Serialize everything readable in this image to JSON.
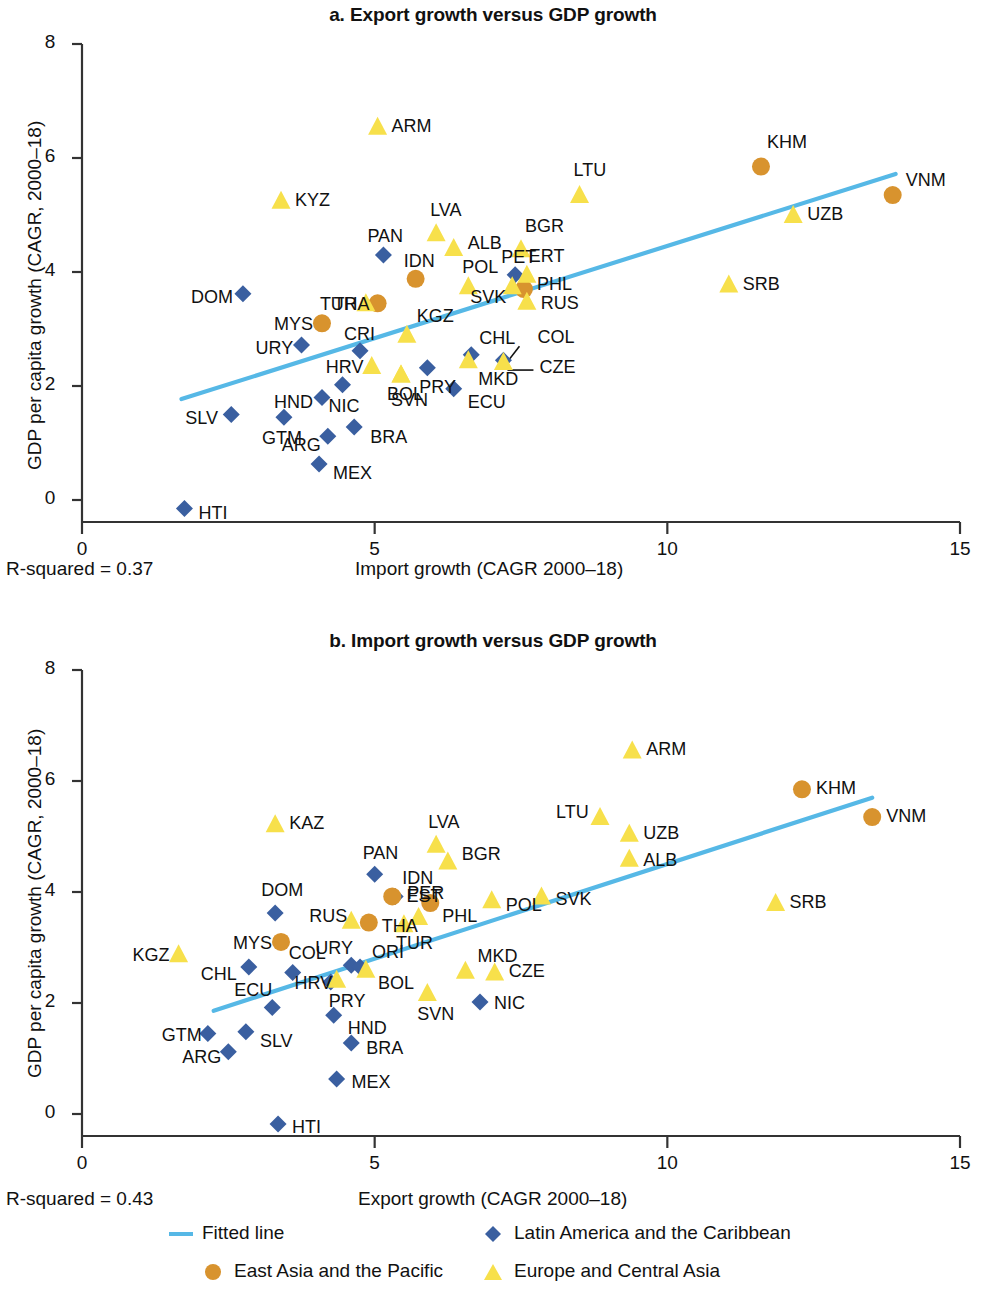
{
  "figure": {
    "colors": {
      "fitted_line": "#56b8e6",
      "latin_america": "#3a5fa0",
      "east_asia": "#d8932e",
      "europe_central_asia": "#f7e04b",
      "axis": "#333333",
      "text": "#111111"
    },
    "legend": [
      {
        "label": "Fitted line",
        "marker": "line",
        "color": "#56b8e6"
      },
      {
        "label": "Latin America and the Caribbean",
        "marker": "diamond",
        "color": "#3a5fa0"
      },
      {
        "label": "East Asia and the Pacific",
        "marker": "circle",
        "color": "#d8932e"
      },
      {
        "label": "Europe and Central Asia",
        "marker": "triangle",
        "color": "#f7e04b"
      }
    ]
  },
  "chart_data": [
    {
      "panel": "a",
      "type": "scatter",
      "title": "a. Export growth versus GDP growth",
      "xlabel": "Import growth (CAGR 2000–18)",
      "ylabel": "GDP per capita growth (CAGR, 2000–18)",
      "xlim": [
        0,
        15
      ],
      "ylim": [
        0,
        8
      ],
      "xticks": [
        0,
        5,
        10,
        15
      ],
      "xtick_labels": [
        "0",
        "5",
        "10",
        "15"
      ],
      "yticks": [
        0,
        2,
        4,
        6,
        8
      ],
      "ytick_labels": [
        "0",
        "2",
        "4",
        "6",
        "8"
      ],
      "grid": false,
      "annotation": "R-squared = 0.37",
      "r_squared": 0.37,
      "fit_line": {
        "x": [
          1.7,
          13.9
        ],
        "y": [
          1.77,
          5.72
        ]
      },
      "series": [
        {
          "name": "Latin America and the Caribbean",
          "marker": "diamond",
          "color": "#3a5fa0",
          "points": [
            {
              "code": "HTI",
              "x": 1.75,
              "y": -0.15,
              "lx": 14,
              "ly": 5
            },
            {
              "code": "SLV",
              "x": 2.55,
              "y": 1.5,
              "lx": -46,
              "ly": 4
            },
            {
              "code": "GTM",
              "x": 3.45,
              "y": 1.45,
              "lx": -22,
              "ly": 22
            },
            {
              "code": "ARG",
              "x": 4.2,
              "y": 1.12,
              "lx": -46,
              "ly": 10
            },
            {
              "code": "MEX",
              "x": 4.05,
              "y": 0.63,
              "lx": 14,
              "ly": 10
            },
            {
              "code": "BRA",
              "x": 4.65,
              "y": 1.28,
              "lx": 16,
              "ly": 11
            },
            {
              "code": "HND",
              "x": 4.1,
              "y": 1.8,
              "lx": -48,
              "ly": 6
            },
            {
              "code": "NIC",
              "x": 4.45,
              "y": 2.02,
              "lx": -14,
              "ly": 22
            },
            {
              "code": "URY",
              "x": 3.75,
              "y": 2.72,
              "lx": -46,
              "ly": 4
            },
            {
              "code": "CRI",
              "x": 4.75,
              "y": 2.62,
              "lx": -16,
              "ly": -16
            },
            {
              "code": "PRY",
              "x": 5.9,
              "y": 2.32,
              "lx": -8,
              "ly": 20
            },
            {
              "code": "ECU",
              "x": 6.35,
              "y": 1.95,
              "lx": 14,
              "ly": 14
            },
            {
              "code": "CHL",
              "x": 6.65,
              "y": 2.55,
              "lx": 8,
              "ly": -16
            },
            {
              "code": "COL",
              "x": 7.2,
              "y": 2.45,
              "lx": 34,
              "ly": -22
            },
            {
              "code": "PAN",
              "x": 5.15,
              "y": 4.3,
              "lx": -16,
              "ly": -18
            },
            {
              "code": "DOM",
              "x": 2.75,
              "y": 3.62,
              "lx": -52,
              "ly": 4
            },
            {
              "code": "PET",
              "x": 7.4,
              "y": 3.95,
              "lx": -14,
              "ly": -17
            }
          ]
        },
        {
          "name": "East Asia and the Pacific",
          "marker": "circle",
          "color": "#d8932e",
          "points": [
            {
              "code": "MYS",
              "x": 4.1,
              "y": 3.1,
              "lx": -48,
              "ly": 2
            },
            {
              "code": "THA",
              "x": 5.05,
              "y": 3.45,
              "lx": -44,
              "ly": 2
            },
            {
              "code": "IDN",
              "x": 5.7,
              "y": 3.88,
              "lx": -12,
              "ly": -17
            },
            {
              "code": "PHL",
              "x": 7.55,
              "y": 3.7,
              "lx": 13,
              "ly": -4
            },
            {
              "code": "KHM",
              "x": 11.6,
              "y": 5.85,
              "lx": 6,
              "ly": -24
            },
            {
              "code": "VNM",
              "x": 13.85,
              "y": 5.35,
              "lx": 13,
              "ly": -14
            }
          ]
        },
        {
          "name": "Europe and Central Asia",
          "marker": "triangle",
          "color": "#f7e04b",
          "points": [
            {
              "code": "ARM",
              "x": 5.05,
              "y": 6.55,
              "lx": 14,
              "ly": 0
            },
            {
              "code": "KYZ",
              "x": 3.4,
              "y": 5.25,
              "lx": 14,
              "ly": 0
            },
            {
              "code": "LVA",
              "x": 6.05,
              "y": 4.68,
              "lx": -6,
              "ly": -22
            },
            {
              "code": "ALB",
              "x": 6.35,
              "y": 4.42,
              "lx": 14,
              "ly": -4
            },
            {
              "code": "LTU",
              "x": 8.5,
              "y": 5.35,
              "lx": -6,
              "ly": -24
            },
            {
              "code": "BGR",
              "x": 7.5,
              "y": 4.4,
              "lx": 4,
              "ly": -22
            },
            {
              "code": "UZB",
              "x": 12.15,
              "y": 5.0,
              "lx": 14,
              "ly": 0
            },
            {
              "code": "SRB",
              "x": 11.05,
              "y": 3.78,
              "lx": 14,
              "ly": 0
            },
            {
              "code": "POL",
              "x": 6.6,
              "y": 3.75,
              "lx": -6,
              "ly": -18
            },
            {
              "code": "ERT",
              "x": 7.6,
              "y": 3.95,
              "lx": 2,
              "ly": -18
            },
            {
              "code": "RUS",
              "x": 7.6,
              "y": 3.48,
              "lx": 14,
              "ly": 2
            },
            {
              "code": "TUR",
              "x": 4.85,
              "y": 3.45,
              "lx": -46,
              "ly": 2
            },
            {
              "code": "KGZ",
              "x": 5.55,
              "y": 2.9,
              "lx": 10,
              "ly": -18
            },
            {
              "code": "HRV",
              "x": 4.95,
              "y": 2.35,
              "lx": -46,
              "ly": 2
            },
            {
              "code": "BOL",
              "x": 5.45,
              "y": 2.2,
              "lx": -14,
              "ly": 20
            },
            {
              "code": "SVN",
              "x": 5.45,
              "y": 2.2,
              "lx": -10,
              "ly": 26
            },
            {
              "code": "MKD",
              "x": 6.6,
              "y": 2.45,
              "lx": 10,
              "ly": 20
            },
            {
              "code": "CZE",
              "x": 7.2,
              "y": 2.42,
              "lx": 36,
              "ly": 6
            },
            {
              "code": "SVK",
              "x": 7.35,
              "y": 3.75,
              "lx": -42,
              "ly": 12
            }
          ]
        }
      ]
    },
    {
      "panel": "b",
      "type": "scatter",
      "title": "b. Import growth versus GDP growth",
      "xlabel": "Export growth (CAGR 2000–18)",
      "ylabel": "GDP per capita growth (CAGR, 2000–18)",
      "xlim": [
        0,
        15
      ],
      "ylim": [
        0,
        8
      ],
      "xticks": [
        0,
        5,
        10,
        15
      ],
      "xtick_labels": [
        "0",
        "5",
        "10",
        "15"
      ],
      "yticks": [
        0,
        2,
        4,
        6,
        8
      ],
      "ytick_labels": [
        "0",
        "2",
        "4",
        "6",
        "8"
      ],
      "grid": false,
      "annotation": "R-squared = 0.43",
      "r_squared": 0.43,
      "fit_line": {
        "x": [
          2.25,
          13.5
        ],
        "y": [
          1.86,
          5.7
        ]
      },
      "series": [
        {
          "name": "Latin America and the Caribbean",
          "marker": "diamond",
          "color": "#3a5fa0",
          "points": [
            {
              "code": "HTI",
              "x": 3.35,
              "y": -0.18,
              "lx": 14,
              "ly": 4
            },
            {
              "code": "ARG",
              "x": 2.5,
              "y": 1.12,
              "lx": -46,
              "ly": 6
            },
            {
              "code": "GTM",
              "x": 2.15,
              "y": 1.45,
              "lx": -46,
              "ly": 2
            },
            {
              "code": "SLV",
              "x": 2.8,
              "y": 1.48,
              "lx": 14,
              "ly": 10
            },
            {
              "code": "MEX",
              "x": 4.35,
              "y": 0.63,
              "lx": 15,
              "ly": 4
            },
            {
              "code": "BRA",
              "x": 4.6,
              "y": 1.28,
              "lx": 15,
              "ly": 6
            },
            {
              "code": "HND",
              "x": 4.3,
              "y": 1.78,
              "lx": 14,
              "ly": 14
            },
            {
              "code": "ECU",
              "x": 3.25,
              "y": 1.92,
              "lx": -38,
              "ly": -16
            },
            {
              "code": "CHL",
              "x": 2.85,
              "y": 2.65,
              "lx": -48,
              "ly": 8
            },
            {
              "code": "COL",
              "x": 3.6,
              "y": 2.55,
              "lx": -4,
              "ly": -18
            },
            {
              "code": "URY",
              "x": 4.6,
              "y": 2.68,
              "lx": -36,
              "ly": -16
            },
            {
              "code": "ORI",
              "x": 4.75,
              "y": 2.65,
              "lx": 12,
              "ly": -14
            },
            {
              "code": "PRY",
              "x": 4.25,
              "y": 2.38,
              "lx": -2,
              "ly": 20
            },
            {
              "code": "DOM",
              "x": 3.3,
              "y": 3.62,
              "lx": -14,
              "ly": -22
            },
            {
              "code": "PAN",
              "x": 5.0,
              "y": 4.32,
              "lx": -12,
              "ly": -20
            },
            {
              "code": "NIC",
              "x": 6.8,
              "y": 2.02,
              "lx": 14,
              "ly": 2
            },
            {
              "code": "PER",
              "x": 5.35,
              "y": 3.92,
              "lx": 12,
              "ly": -2
            }
          ]
        },
        {
          "name": "East Asia and the Pacific",
          "marker": "circle",
          "color": "#d8932e",
          "points": [
            {
              "code": "MYS",
              "x": 3.4,
              "y": 3.1,
              "lx": -48,
              "ly": 2
            },
            {
              "code": "THA",
              "x": 4.9,
              "y": 3.45,
              "lx": 13,
              "ly": 4
            },
            {
              "code": "IDN",
              "x": 5.3,
              "y": 3.92,
              "lx": 10,
              "ly": -17
            },
            {
              "code": "PHL",
              "x": 5.95,
              "y": 3.8,
              "lx": 12,
              "ly": 14
            },
            {
              "code": "KHM",
              "x": 12.3,
              "y": 5.85,
              "lx": 14,
              "ly": 0
            },
            {
              "code": "VNM",
              "x": 13.5,
              "y": 5.35,
              "lx": 14,
              "ly": 0
            }
          ]
        },
        {
          "name": "Europe and Central Asia",
          "marker": "triangle",
          "color": "#f7e04b",
          "points": [
            {
              "code": "KAZ",
              "x": 3.3,
              "y": 5.22,
              "lx": 14,
              "ly": 0
            },
            {
              "code": "KGZ",
              "x": 1.65,
              "y": 2.88,
              "lx": -46,
              "ly": 2
            },
            {
              "code": "HRV",
              "x": 4.35,
              "y": 2.42,
              "lx": -42,
              "ly": 4
            },
            {
              "code": "BOL",
              "x": 4.85,
              "y": 2.6,
              "lx": 12,
              "ly": 14
            },
            {
              "code": "RUS",
              "x": 4.6,
              "y": 3.48,
              "lx": -42,
              "ly": -4
            },
            {
              "code": "TUR",
              "x": 5.5,
              "y": 3.42,
              "lx": -8,
              "ly": 20
            },
            {
              "code": "EST",
              "x": 5.75,
              "y": 3.55,
              "lx": -12,
              "ly": -20
            },
            {
              "code": "LVA",
              "x": 6.05,
              "y": 4.85,
              "lx": -8,
              "ly": -22
            },
            {
              "code": "BGR",
              "x": 6.25,
              "y": 4.55,
              "lx": 14,
              "ly": -6
            },
            {
              "code": "SVN",
              "x": 5.9,
              "y": 2.18,
              "lx": -10,
              "ly": 22
            },
            {
              "code": "MKD",
              "x": 6.55,
              "y": 2.58,
              "lx": 12,
              "ly": -14
            },
            {
              "code": "CZE",
              "x": 7.05,
              "y": 2.55,
              "lx": 14,
              "ly": 0
            },
            {
              "code": "POL",
              "x": 7.0,
              "y": 3.85,
              "lx": 14,
              "ly": 6
            },
            {
              "code": "SVK",
              "x": 7.85,
              "y": 3.92,
              "lx": 14,
              "ly": 4
            },
            {
              "code": "LTU",
              "x": 8.85,
              "y": 5.35,
              "lx": -44,
              "ly": -4
            },
            {
              "code": "UZB",
              "x": 9.35,
              "y": 5.05,
              "lx": 14,
              "ly": 0
            },
            {
              "code": "ALB",
              "x": 9.35,
              "y": 4.6,
              "lx": 14,
              "ly": 2
            },
            {
              "code": "ARM",
              "x": 9.4,
              "y": 6.55,
              "lx": 14,
              "ly": 0
            },
            {
              "code": "SRB",
              "x": 11.85,
              "y": 3.8,
              "lx": 14,
              "ly": 0
            }
          ]
        }
      ]
    }
  ]
}
